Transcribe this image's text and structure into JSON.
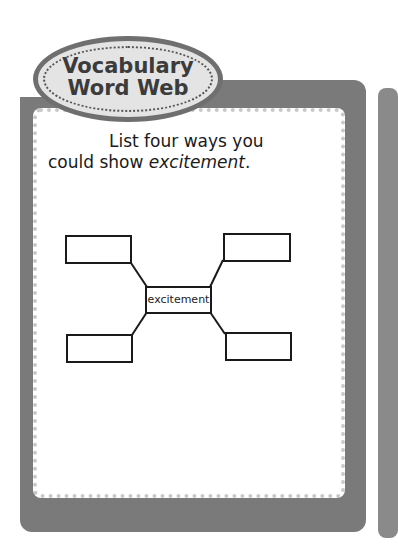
{
  "badge": {
    "line1": "Vocabulary",
    "line2": "Word Web"
  },
  "prompt": {
    "line1": "List four ways you",
    "line2_prefix": "could show ",
    "line2_word": "excitement",
    "line2_suffix": "."
  },
  "web": {
    "center": "excitement",
    "branches": [
      "",
      "",
      "",
      ""
    ]
  },
  "colors": {
    "frame": "#7a7a7a",
    "dots": "#c9c9c9",
    "badge_fill": "#e4e4e4"
  }
}
